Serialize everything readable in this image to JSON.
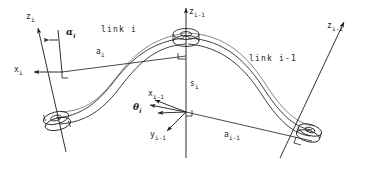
{
  "figure": {
    "type": "technical-line-diagram",
    "background_color": "#ffffff",
    "line_color": "#1a1a1a",
    "width": 367,
    "height": 169
  },
  "labels": {
    "z_i": {
      "base": "z",
      "sub": "i"
    },
    "x_i": {
      "base": "x",
      "sub": "i"
    },
    "alpha_i": {
      "base": "α",
      "sub": "i"
    },
    "a_i": {
      "base": "a",
      "sub": "i"
    },
    "link_i": {
      "text": "link i"
    },
    "z_im1": {
      "base": "z",
      "sub": "i-1"
    },
    "s_i": {
      "base": "s",
      "sub": "i"
    },
    "x_im1": {
      "base": "x",
      "sub": "i-1"
    },
    "y_im1": {
      "base": "y",
      "sub": "i-1"
    },
    "theta_i": {
      "base": "θ",
      "sub": "i"
    },
    "a_im1": {
      "base": "a",
      "sub": "i-1"
    },
    "link_im1": {
      "text": "link i-1"
    },
    "z_im2": {
      "base": "z",
      "sub": "i-2"
    }
  },
  "geometry": {
    "joints": [
      {
        "name": "joint-left",
        "x": 56,
        "y": 118
      },
      {
        "name": "joint-center",
        "x": 186,
        "y": 38
      },
      {
        "name": "joint-right",
        "x": 310,
        "y": 130
      }
    ],
    "axes": [
      {
        "name": "z-i",
        "from": [
          62,
          148
        ],
        "to": [
          34,
          22
        ]
      },
      {
        "name": "x-i",
        "from": [
          62,
          72
        ],
        "to": [
          13,
          72
        ]
      },
      {
        "name": "z-i-minus-1",
        "from": [
          186,
          158
        ],
        "to": [
          186,
          10
        ]
      },
      {
        "name": "x-i-minus-1",
        "from": [
          186,
          112
        ],
        "to": [
          140,
          104
        ]
      },
      {
        "name": "y-i-minus-1",
        "from": [
          186,
          112
        ],
        "to": [
          163,
          133
        ]
      },
      {
        "name": "z-i-minus-2",
        "from": [
          282,
          155
        ],
        "to": [
          341,
          24
        ]
      },
      {
        "name": "a-i",
        "from": [
          62,
          72
        ],
        "to": [
          186,
          56
        ]
      },
      {
        "name": "a-i-minus-1",
        "from": [
          186,
          112
        ],
        "to": [
          310,
          140
        ]
      }
    ],
    "right_angle_markers": [
      {
        "name": "ra-origin-i",
        "x": 62,
        "y": 72
      },
      {
        "name": "ra-center-top",
        "x": 186,
        "y": 56
      },
      {
        "name": "ra-center-bottom",
        "x": 186,
        "y": 112
      },
      {
        "name": "ra-right",
        "x": 305,
        "y": 140
      }
    ]
  }
}
